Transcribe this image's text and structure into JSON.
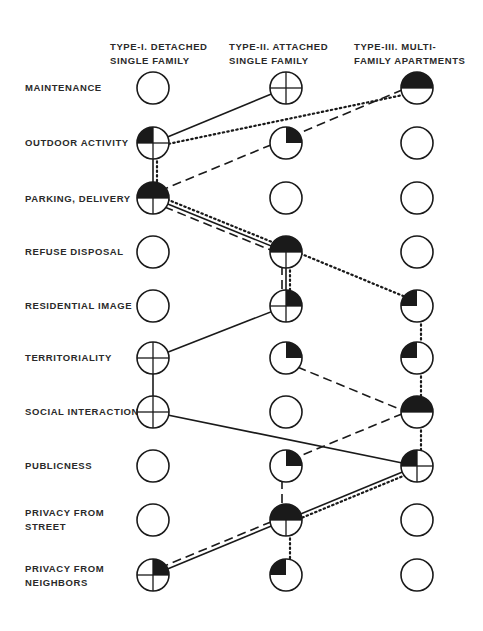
{
  "columns": [
    {
      "line1": "TYPE-I. DETACHED",
      "line2": "SINGLE FAMILY",
      "x": 153
    },
    {
      "line1": "TYPE-II. ATTACHED",
      "line2": "SINGLE FAMILY",
      "x": 286
    },
    {
      "line1": "TYPE-III. MULTI-",
      "line2": "FAMILY APARTMENTS",
      "x": 417
    }
  ],
  "rows": [
    {
      "line1": "MAINTENANCE",
      "line2": "",
      "y": 88,
      "symbols": [
        "empty",
        "cross",
        "half"
      ]
    },
    {
      "line1": "OUTDOOR ACTIVITY",
      "line2": "",
      "y": 143,
      "symbols": [
        "cross-tl",
        "quarter-tr",
        "empty"
      ]
    },
    {
      "line1": "PARKING, DELIVERY",
      "line2": "",
      "y": 198,
      "symbols": [
        "half-t",
        "empty",
        "empty"
      ]
    },
    {
      "line1": "REFUSE DISPOSAL",
      "line2": "",
      "y": 252,
      "symbols": [
        "empty",
        "half-t",
        "empty"
      ]
    },
    {
      "line1": "RESIDENTIAL IMAGE",
      "line2": "",
      "y": 306,
      "symbols": [
        "empty",
        "cross-tr",
        "quarter-tl"
      ]
    },
    {
      "line1": "TERRITORIALITY",
      "line2": "",
      "y": 358,
      "symbols": [
        "cross",
        "quarter-tr",
        "quarter-tl"
      ]
    },
    {
      "line1": "SOCIAL INTERACTION",
      "line2": "",
      "y": 412,
      "symbols": [
        "cross",
        "empty",
        "half"
      ]
    },
    {
      "line1": "PUBLICNESS",
      "line2": "",
      "y": 466,
      "symbols": [
        "empty",
        "quarter-tr",
        "cross-tl"
      ]
    },
    {
      "line1": "PRIVACY FROM",
      "line2": "STREET",
      "y": 520,
      "symbols": [
        "empty",
        "half-t",
        "empty"
      ]
    },
    {
      "line1": "PRIVACY FROM",
      "line2": "NEIGHBORS",
      "y": 575,
      "symbols": [
        "cross-tr",
        "quarter-tl",
        "empty"
      ]
    }
  ],
  "connections": {
    "solid": [
      [
        0,
        1,
        1,
        0
      ],
      [
        1,
        0,
        2,
        0
      ],
      [
        2,
        0,
        3,
        1
      ],
      [
        3,
        1,
        4,
        1
      ],
      [
        4,
        1,
        5,
        0
      ],
      [
        5,
        0,
        6,
        0
      ],
      [
        6,
        0,
        7,
        2
      ],
      [
        7,
        2,
        8,
        1
      ],
      [
        8,
        1,
        9,
        0
      ]
    ],
    "dotted": [
      [
        0,
        2,
        1,
        0
      ],
      [
        1,
        0,
        2,
        0
      ],
      [
        2,
        0,
        3,
        1
      ],
      [
        3,
        1,
        4,
        1
      ],
      [
        3,
        1,
        4,
        2
      ],
      [
        4,
        2,
        5,
        2
      ],
      [
        5,
        2,
        6,
        2
      ],
      [
        6,
        2,
        7,
        2
      ],
      [
        7,
        2,
        8,
        1
      ],
      [
        8,
        1,
        9,
        1
      ]
    ],
    "dashed": [
      [
        0,
        2,
        1,
        1
      ],
      [
        1,
        1,
        2,
        0
      ],
      [
        2,
        0,
        3,
        1
      ],
      [
        3,
        1,
        4,
        1
      ],
      [
        5,
        1,
        6,
        2
      ],
      [
        6,
        2,
        7,
        1
      ],
      [
        7,
        1,
        8,
        1
      ],
      [
        8,
        1,
        9,
        0
      ]
    ]
  },
  "legend_note": "Symbols: empty circle, crosshair circle, filled quadrants/halves indicate degree of concern per housing type",
  "style": {
    "ink": "#1a1a1a",
    "radius": 16
  }
}
